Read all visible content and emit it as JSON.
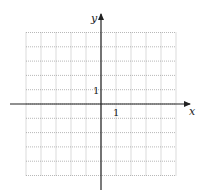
{
  "chart_data": {
    "type": "scatter",
    "title": "",
    "xlabel": "x",
    "ylabel": "y",
    "xlim": [
      -5,
      5
    ],
    "ylim": [
      -5,
      5
    ],
    "grid": true,
    "grid_style": "dotted",
    "x_tick_labels": [
      {
        "value": 1,
        "label": "1"
      }
    ],
    "y_tick_labels": [
      {
        "value": 1,
        "label": "1"
      }
    ],
    "series": []
  },
  "labels": {
    "x_axis": "x",
    "y_axis": "y",
    "x_unit": "1",
    "y_unit": "1"
  },
  "colors": {
    "grid": "#9a9a9a",
    "axis": "#222222"
  }
}
